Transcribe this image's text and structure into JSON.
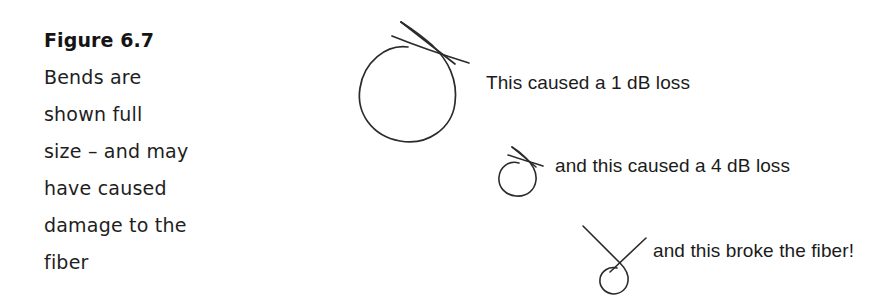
{
  "figure": {
    "caption": {
      "title": "Figure 6.7",
      "lines": [
        "Bends are",
        "shown full",
        "size – and may",
        "have caused",
        "damage to the",
        "fiber"
      ]
    },
    "annotations": [
      {
        "id": "loss-1db",
        "text": "This caused a 1 dB loss",
        "shape": "large-fiber-loop",
        "loss_db": 1
      },
      {
        "id": "loss-4db",
        "text": "and this caused a 4 dB loss",
        "shape": "small-fiber-loop",
        "loss_db": 4
      },
      {
        "id": "broken-fiber",
        "text": "and this broke the fiber!",
        "shape": "tiny-fiber-loop-broken",
        "loss_db": null
      }
    ],
    "colors": {
      "background": "#ffffff",
      "text": "#1a1a1a",
      "stroke": "#2b2b2b"
    }
  }
}
